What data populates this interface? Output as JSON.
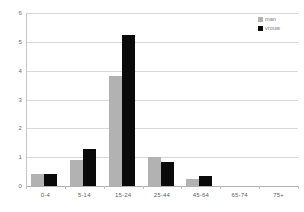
{
  "chart_data": {
    "type": "bar",
    "title": "",
    "subtitle": "",
    "xlabel": "",
    "ylabel": "",
    "categories": [
      "0-4",
      "5-14",
      "15-24",
      "25-44",
      "45-64",
      "65-74",
      "75+"
    ],
    "series": [
      {
        "name": "man",
        "color": "#b2b2b2",
        "values": [
          0.4,
          0.9,
          3.8,
          1.0,
          0.25,
          0,
          0
        ]
      },
      {
        "name": "vrouw",
        "color": "#0a0a0a",
        "values": [
          0.43,
          1.3,
          5.25,
          0.85,
          0.35,
          0,
          0
        ]
      }
    ],
    "ylim": [
      0,
      6
    ],
    "y_ticks": [
      0,
      1,
      2,
      3,
      4,
      5,
      6
    ],
    "y_tick_labels": [
      "0",
      "1",
      "2",
      "3",
      "4",
      "5",
      "6"
    ],
    "grid": true,
    "grid_axis": "y",
    "grid_color": "#d8d8d8",
    "legend_position": "top-right",
    "background_color": "#ffffff",
    "axis_color": "#c4c4c4"
  },
  "legend": {
    "items": [
      {
        "label": "man",
        "swatch": "legend-swatch-man"
      },
      {
        "label": "vrouw",
        "swatch": "legend-swatch-vrouw"
      }
    ]
  }
}
